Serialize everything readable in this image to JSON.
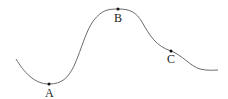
{
  "diagram": {
    "curve_color": "#6b6b6b",
    "points": [
      {
        "id": "A",
        "label": "A",
        "x": 49,
        "y": 84,
        "label_x": 45,
        "label_y": 97
      },
      {
        "id": "B",
        "label": "B",
        "x": 118,
        "y": 9,
        "label_x": 114,
        "label_y": 22
      },
      {
        "id": "C",
        "label": "C",
        "x": 171,
        "y": 51,
        "label_x": 167,
        "label_y": 63
      }
    ]
  }
}
